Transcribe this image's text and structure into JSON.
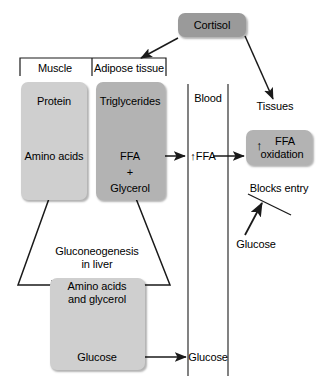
{
  "diagram": {
    "colors": {
      "box_dark": "#9a9a9a",
      "box_mid": "#b3b3b3",
      "box_light": "#cfcfcf",
      "stroke": "#1a1a1a",
      "background": "#ffffff"
    }
  },
  "nodes": {
    "cortisol": "Cortisol",
    "muscle_header": "Muscle",
    "adipose_header": "Adipose tissue",
    "protein": "Protein",
    "amino_acids": "Amino acids",
    "triglycerides": "Triglycerides",
    "ffa": "FFA",
    "plus": "+",
    "glycerol": "Glycerol",
    "blood": "Blood",
    "blood_ffa": "↑FFA",
    "tissues": "Tissues",
    "ffa_oxidation_arrow": "↑",
    "ffa_oxidation_line1": "FFA",
    "ffa_oxidation_line2": "oxidation",
    "blocks_entry": "Blocks entry",
    "glucose_uptake": "Glucose",
    "gluconeogenesis_line1": "Gluconeogenesis",
    "gluconeogenesis_line2": "in liver",
    "liver_substrates_line1": "Amino acids",
    "liver_substrates_line2": "and glycerol",
    "liver_glucose": "Glucose",
    "blood_glucose": "Glucose"
  }
}
